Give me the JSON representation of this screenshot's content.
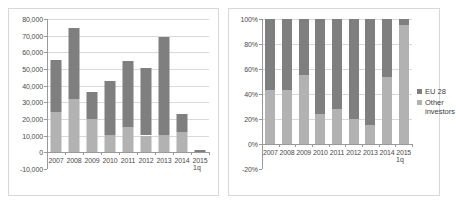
{
  "colors": {
    "eu": "#7f7f7f",
    "other": "#b2b2b2",
    "grid": "#d9d9d9",
    "axis": "#9a9a9a",
    "frame": "#d8d8d8",
    "text": "#4a4a4a"
  },
  "legend": {
    "eu_label": "EU 28",
    "other_label": "Other\ninvestors"
  },
  "notes": {
    "quarter": "1q"
  },
  "chart_data": [
    {
      "type": "bar",
      "id": "absolute-values",
      "title": "",
      "stacked": true,
      "xlabel": "",
      "ylabel": "",
      "grid": true,
      "legend_position": "none",
      "categories": [
        "2007",
        "2008",
        "2009",
        "2010",
        "2011",
        "2012",
        "2013",
        "2014",
        "2015"
      ],
      "ytick_labels": [
        "80,000",
        "70,000",
        "60,000",
        "50,000",
        "40,000",
        "30,000",
        "20,000",
        "10,000",
        "0",
        "-10,000"
      ],
      "ytick_values": [
        80000,
        70000,
        60000,
        50000,
        40000,
        30000,
        20000,
        10000,
        0,
        -10000
      ],
      "ylim": [
        -10000,
        80000
      ],
      "series": [
        {
          "name": "Other investors",
          "color": "#b2b2b2",
          "values": [
            24200,
            32200,
            19800,
            10300,
            15200,
            10100,
            10500,
            12300,
            400
          ]
        },
        {
          "name": "EU 28",
          "color": "#7f7f7f",
          "values": [
            31400,
            42400,
            16500,
            32700,
            39800,
            40700,
            58700,
            10700,
            900
          ]
        }
      ],
      "totals": [
        55600,
        74600,
        36300,
        43000,
        55000,
        50800,
        69200,
        23000,
        1300
      ]
    },
    {
      "type": "bar",
      "id": "percentage-shares",
      "title": "",
      "stacked": true,
      "xlabel": "",
      "ylabel": "",
      "grid": true,
      "legend_position": "right",
      "categories": [
        "2007",
        "2008",
        "2009",
        "2010",
        "2011",
        "2012",
        "2013",
        "2014",
        "2015"
      ],
      "ytick_labels": [
        "100%",
        "80%",
        "60%",
        "40%",
        "20%",
        "0%",
        "-20%"
      ],
      "ytick_values": [
        100,
        80,
        60,
        40,
        20,
        0,
        -20
      ],
      "ylim": [
        -20,
        100
      ],
      "series": [
        {
          "name": "Other investors",
          "color": "#b2b2b2",
          "values": [
            43,
            43,
            55,
            24,
            28,
            20,
            15,
            54,
            95
          ]
        },
        {
          "name": "EU 28",
          "color": "#7f7f7f",
          "values": [
            57,
            57,
            45,
            76,
            72,
            80,
            85,
            46,
            5
          ]
        }
      ]
    }
  ]
}
